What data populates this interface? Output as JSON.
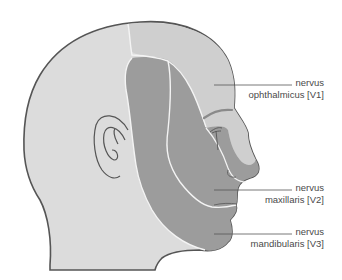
{
  "diagram": {
    "colors": {
      "skin": "#dcdcdc",
      "v1_region": "#cfcfcf",
      "v2_v3_region": "#9c9c9c",
      "outline": "#555555",
      "divider": "#f4f4f4",
      "leader_line": "#555555",
      "text": "#4a4a4a"
    },
    "labels": [
      {
        "id": "v1",
        "line1": "nervus",
        "line2": "ophthalmicus [V1]"
      },
      {
        "id": "v2",
        "line1": "nervus",
        "line2": "maxillaris [V2]"
      },
      {
        "id": "v3",
        "line1": "nervus",
        "line2": "mandibularis [V3]"
      }
    ]
  }
}
